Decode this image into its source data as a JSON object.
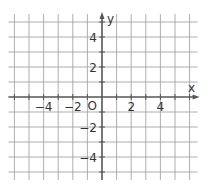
{
  "chart_data": {
    "type": "scatter",
    "title": "",
    "xlabel": "x",
    "ylabel": "y",
    "xlim": [
      -6,
      6
    ],
    "ylim": [
      -5,
      5
    ],
    "grid": true,
    "x_ticks": [
      -6,
      -5,
      -4,
      -3,
      -2,
      -1,
      0,
      1,
      2,
      3,
      4,
      5,
      6
    ],
    "y_ticks": [
      -5,
      -4,
      -3,
      -2,
      -1,
      0,
      1,
      2,
      3,
      4,
      5
    ],
    "x_tick_labels": [
      "-4",
      "-2",
      "2",
      "4"
    ],
    "y_tick_labels": [
      "4",
      "2",
      "-2",
      "-4"
    ],
    "origin_label": "O",
    "series": []
  },
  "axes": {
    "x_label": "x",
    "y_label": "y",
    "origin_label": "O",
    "x_labels": [
      {
        "value": -4,
        "text": "−4"
      },
      {
        "value": -2,
        "text": "−2"
      },
      {
        "value": 2,
        "text": "2"
      },
      {
        "value": 4,
        "text": "4"
      }
    ],
    "y_labels": [
      {
        "value": 4,
        "text": "4"
      },
      {
        "value": 2,
        "text": "2"
      },
      {
        "value": -2,
        "text": "−2"
      },
      {
        "value": -4,
        "text": "−4"
      }
    ]
  },
  "colors": {
    "grid": "#9a9a9a",
    "axis": "#555555",
    "text": "#333333"
  }
}
